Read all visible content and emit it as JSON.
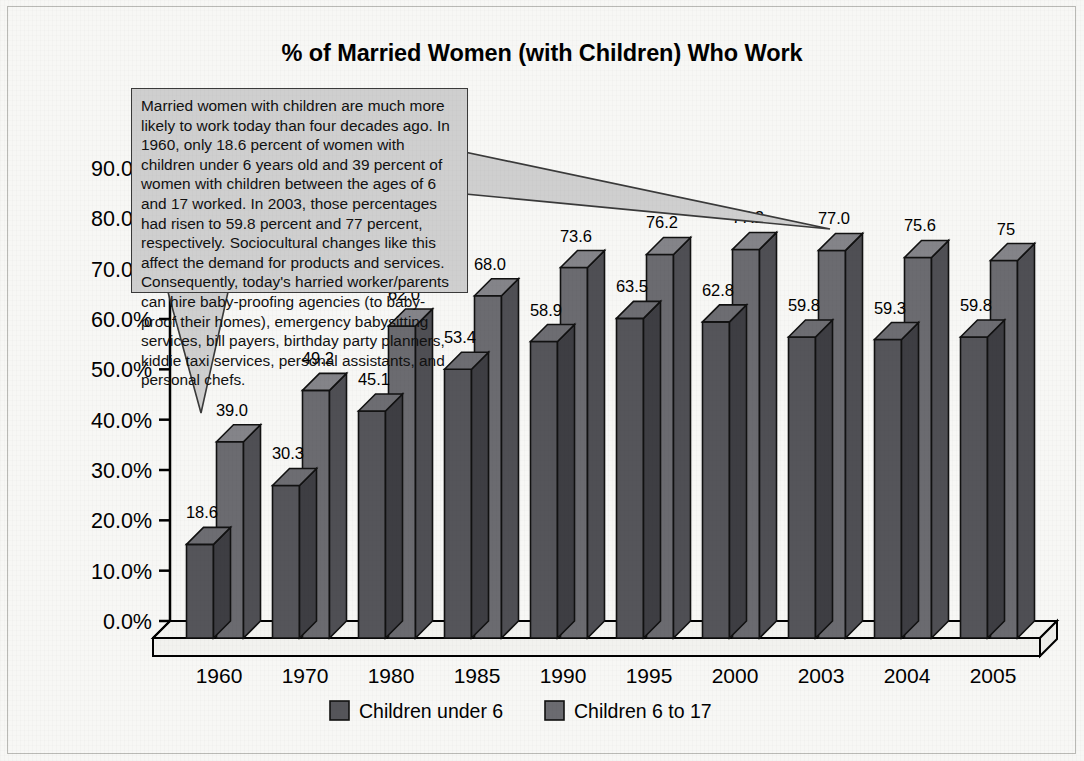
{
  "figure": {
    "title": "% of Married Women (with Children) Who Work",
    "background_color": "#f7f7f5",
    "border_color": "#b9b9b5"
  },
  "annotation": {
    "text": "Married women with children are much more likely to work today than four decades ago. In 1960, only 18.6 percent of women with children under 6 years old and 39 percent of women with children between the ages of 6 and 17 worked. In 2003, those percentages had risen to 59.8 percent and 77 percent, respectively. Sociocultural changes like this affect the demand for products and services. Consequently, today's harried worker/parents can hire baby-proofing agencies (to baby-proof their homes), emergency babysitting services, bill payers, birthday party planners, kiddie taxi services, personal assistants, and personal chefs.",
    "fill_color": "#cfcfcf",
    "border_color": "#3a3a3a"
  },
  "chart_data": {
    "type": "bar",
    "title": "% of Married Women (with Children) Who Work",
    "xlabel": "",
    "ylabel": "",
    "ylim": [
      0,
      90
    ],
    "ytick_step": 10,
    "grid": false,
    "legend_position": "bottom",
    "three_d": true,
    "ytick_labels": [
      "0.0%",
      "10.0%",
      "20.0%",
      "30.0%",
      "40.0%",
      "50.0%",
      "60.0%",
      "70.0%",
      "80.0%",
      "90.0%"
    ],
    "ytick_values": [
      0,
      10,
      20,
      30,
      40,
      50,
      60,
      70,
      80,
      90
    ],
    "categories": [
      "1960",
      "1970",
      "1980",
      "1985",
      "1990",
      "1995",
      "2000",
      "2003",
      "2004",
      "2005"
    ],
    "series": [
      {
        "name": "Children under 6",
        "color": "#55555a",
        "top_color": "#6d6d72",
        "side_color": "#3e3e43",
        "values": [
          18.6,
          30.3,
          45.1,
          53.4,
          58.9,
          63.5,
          62.8,
          59.8,
          59.3,
          59.8
        ],
        "labels": [
          "18.6",
          "30.3",
          "45.1",
          "53.4",
          "58.9",
          "63.5",
          "62.8",
          "59.8",
          "59.3",
          "59.8"
        ]
      },
      {
        "name": "Children 6 to 17",
        "color": "#6b6b70",
        "top_color": "#848489",
        "side_color": "#4f4f54",
        "values": [
          39.0,
          49.2,
          62.0,
          68.0,
          73.6,
          76.2,
          77.2,
          77.0,
          75.6,
          75.0
        ],
        "labels": [
          "39.0",
          "49.2",
          "62.0",
          "68.0",
          "73.6",
          "76.2",
          "77.2",
          "77.0",
          "75.6",
          "75"
        ]
      }
    ]
  },
  "legend": {
    "items": [
      {
        "label": "Children under 6",
        "color": "#55555a"
      },
      {
        "label": "Children 6 to 17",
        "color": "#6b6b70"
      }
    ]
  }
}
